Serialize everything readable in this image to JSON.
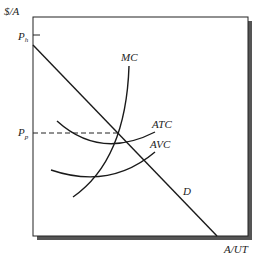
{
  "diagram": {
    "y_axis_label": "$/A",
    "x_axis_label": "A/UT",
    "price_high_label": "P",
    "price_high_sub": "h",
    "price_p_label": "P",
    "price_p_sub": "p",
    "curves": {
      "mc": "MC",
      "atc": "ATC",
      "avc": "AVC",
      "demand": "D"
    },
    "colors": {
      "line": "#1a1a1a",
      "shadow": "#555555"
    }
  }
}
